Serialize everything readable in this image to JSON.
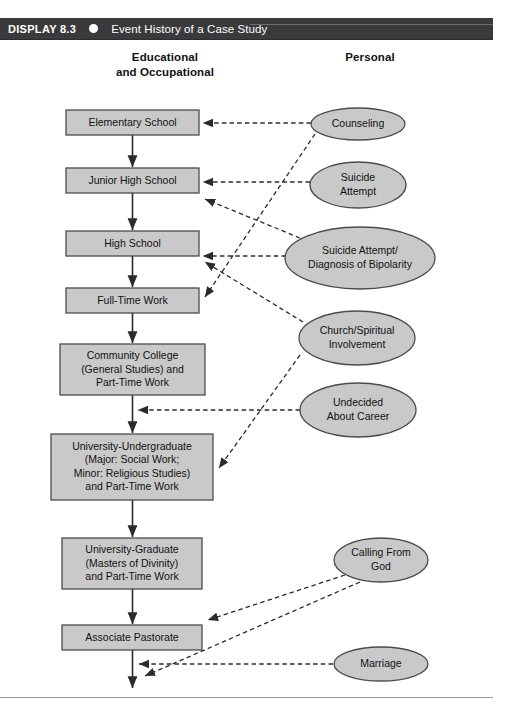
{
  "header": {
    "display_label": "DISPLAY 8.3",
    "bullet_icon": "filled-circle-icon",
    "title": "Event History of a Case Study",
    "bar_color": "#3a3a3c"
  },
  "columns": {
    "left_heading": "Educational\nand Occupational",
    "left_heading_line1": "Educational",
    "left_heading_line2": "and Occupational",
    "right_heading": "Personal"
  },
  "style": {
    "node_fill": "#c9c9c9",
    "node_stroke": "#4c4c4c",
    "line_color": "#2b2b2b"
  },
  "chart_data": {
    "type": "diagram",
    "title": "Event History of a Case Study",
    "subtype": "event-history-flowchart",
    "left_column_label": "Educational and Occupational",
    "right_column_label": "Personal",
    "boxes": [
      {
        "id": "b1",
        "label": "Elementary School",
        "lines": [
          "Elementary School"
        ],
        "x": 66,
        "y": 110,
        "w": 133,
        "h": 25
      },
      {
        "id": "b2",
        "label": "Junior High School",
        "lines": [
          "Junior High School"
        ],
        "x": 66,
        "y": 168,
        "w": 133,
        "h": 25
      },
      {
        "id": "b3",
        "label": "High School",
        "lines": [
          "High School"
        ],
        "x": 66,
        "y": 231,
        "w": 133,
        "h": 25
      },
      {
        "id": "b4",
        "label": "Full-Time Work",
        "lines": [
          "Full-Time Work"
        ],
        "x": 66,
        "y": 288,
        "w": 133,
        "h": 25
      },
      {
        "id": "b5",
        "label": "Community College (General Studies) and Part-Time Work",
        "lines": [
          "Community College",
          "(General Studies) and",
          "Part-Time Work"
        ],
        "x": 60,
        "y": 344,
        "w": 145,
        "h": 51
      },
      {
        "id": "b6",
        "label": "University-Undergraduate (Major: Social Work; Minor: Religious Studies) and Part-Time Work",
        "lines": [
          "University-Undergraduate",
          "(Major: Social Work;",
          "Minor: Religious Studies)",
          "and Part-Time Work"
        ],
        "x": 51,
        "y": 434,
        "w": 162,
        "h": 66
      },
      {
        "id": "b7",
        "label": "University-Graduate (Masters of Divinity) and Part-Time Work",
        "lines": [
          "University-Graduate",
          "(Masters of Divinity)",
          "and Part-Time Work"
        ],
        "x": 62,
        "y": 538,
        "w": 140,
        "h": 51
      },
      {
        "id": "b8",
        "label": "Associate Pastorate",
        "lines": [
          "Associate Pastorate"
        ],
        "x": 62,
        "y": 625,
        "w": 140,
        "h": 25
      }
    ],
    "ellipses": [
      {
        "id": "e1",
        "label": "Counseling",
        "lines": [
          "Counseling"
        ],
        "cx": 358,
        "cy": 124,
        "rx": 47,
        "ry": 16
      },
      {
        "id": "e2",
        "label": "Suicide Attempt",
        "lines": [
          "Suicide",
          "Attempt"
        ],
        "cx": 358,
        "cy": 185,
        "rx": 48,
        "ry": 23
      },
      {
        "id": "e3",
        "label": "Suicide Attempt/ Diagnosis of Bipolarity",
        "lines": [
          "Suicide Attempt/",
          "Diagnosis of Bipolarity"
        ],
        "cx": 360,
        "cy": 258,
        "rx": 75,
        "ry": 31
      },
      {
        "id": "e4",
        "label": "Church/Spiritual Involvement",
        "lines": [
          "Church/Spiritual",
          "Involvement"
        ],
        "cx": 357,
        "cy": 338,
        "rx": 58,
        "ry": 27
      },
      {
        "id": "e5",
        "label": "Undecided About Career",
        "lines": [
          "Undecided",
          "About Career"
        ],
        "cx": 358,
        "cy": 410,
        "rx": 58,
        "ry": 27
      },
      {
        "id": "e6",
        "label": "Calling From God",
        "lines": [
          "Calling From",
          "God"
        ],
        "cx": 381,
        "cy": 560,
        "rx": 47,
        "ry": 22
      },
      {
        "id": "e7",
        "label": "Marriage",
        "lines": [
          "Marriage"
        ],
        "cx": 381,
        "cy": 664,
        "rx": 47,
        "ry": 17
      }
    ],
    "solid_edges": [
      {
        "from": "b1",
        "to": "b2"
      },
      {
        "from": "b2",
        "to": "b3"
      },
      {
        "from": "b3",
        "to": "b4"
      },
      {
        "from": "b4",
        "to": "b5"
      },
      {
        "from": "b5",
        "to": "b6"
      },
      {
        "from": "b6",
        "to": "b7"
      },
      {
        "from": "b7",
        "to": "b8"
      },
      {
        "from": "b8",
        "to": "end"
      }
    ],
    "dashed_edges": [
      {
        "from": "e1",
        "to": "b1",
        "note": "Counseling -> Elementary School"
      },
      {
        "from": "e1",
        "to": "b4",
        "note": "Counseling -> Full-Time Work (crossing)"
      },
      {
        "from": "e2",
        "to": "b2",
        "note": "Suicide Attempt -> Junior High School"
      },
      {
        "from": "e3",
        "to": "b3",
        "note": "Suicide Attempt/Diagnosis of Bipolarity -> High School"
      },
      {
        "from": "e3",
        "to": "b2",
        "note": "Suicide Attempt/Diagnosis of Bipolarity -> Junior High School (crossing)"
      },
      {
        "from": "e4",
        "to": "b3",
        "note": "Church/Spiritual Involvement -> High School (crossing)"
      },
      {
        "from": "e5",
        "to": "b5",
        "note": "Undecided About Career -> Community College"
      },
      {
        "from": "e4",
        "to": "b6",
        "note": "Church/Spiritual Involvement -> University-Undergraduate"
      },
      {
        "from": "e6",
        "to": "b8",
        "note": "Calling From God -> Associate Pastorate"
      },
      {
        "from": "e7",
        "to": "end",
        "note": "Marriage -> end of timeline"
      },
      {
        "from": "e6",
        "to": "end",
        "note": "Calling From God -> end of timeline"
      }
    ]
  }
}
